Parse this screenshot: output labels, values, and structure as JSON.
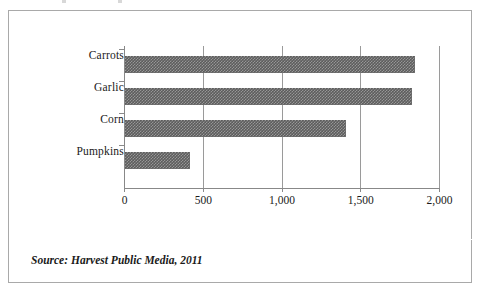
{
  "figure": {
    "source_note": "Source: Harvest Public Media, 2011",
    "frame_color": "#a9a9a9",
    "background_color": "#ffffff",
    "bar_color": "#5d5d5d",
    "axis_color": "#8a8a8a"
  },
  "chart_data": {
    "type": "bar",
    "orientation": "horizontal",
    "title": "",
    "subtitle": "",
    "xlabel": "",
    "ylabel": "",
    "categories": [
      "Carrots",
      "Garlic",
      "Corn",
      "Pumpkins"
    ],
    "values": [
      1840,
      1820,
      1400,
      415
    ],
    "series": [
      {
        "name": "",
        "values": [
          1840,
          1820,
          1400,
          415
        ]
      }
    ],
    "xlim": [
      0,
      2000
    ],
    "xticks": [
      0,
      500,
      1000,
      1500,
      2000
    ],
    "xtick_labels": [
      "0",
      "500",
      "1,000",
      "1,500",
      "2,000"
    ],
    "grid": true,
    "grid_axis": "x",
    "legend": false,
    "legend_position": "none",
    "annotations": [
      "Source: Harvest Public Media, 2011"
    ]
  }
}
